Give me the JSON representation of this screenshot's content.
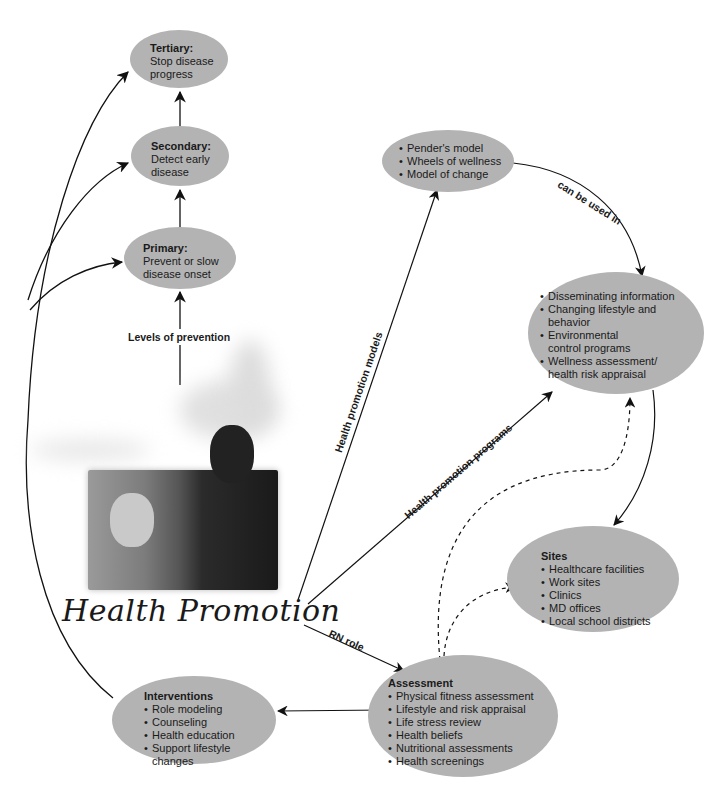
{
  "diagram": {
    "title": "Health Promotion",
    "colors": {
      "ellipse_fill": "#b3b3b3",
      "line": "#111111",
      "text": "#1a1a1a"
    },
    "prevention": {
      "link_label": "Levels of prevention",
      "tertiary": {
        "title": "Tertiary:",
        "text": "Stop disease progress"
      },
      "secondary": {
        "title": "Secondary:",
        "text": "Detect early disease"
      },
      "primary": {
        "title": "Primary:",
        "text": "Prevent or slow disease onset"
      }
    },
    "models": {
      "link_label": "Health promotion models",
      "items": [
        "Pender's model",
        "Wheels of wellness",
        "Model of change"
      ],
      "connector_label": "can be used in"
    },
    "programs": {
      "link_label": "Health promotion programs",
      "items": [
        "Disseminating information",
        "Changing lifestyle and behavior",
        "Environmental control programs",
        "Wellness assessment/ health risk appraisal"
      ]
    },
    "sites": {
      "title": "Sites",
      "items": [
        "Healthcare facilities",
        "Work sites",
        "Clinics",
        "MD offices",
        "Local school districts"
      ]
    },
    "assessment": {
      "link_label": "RN role",
      "title": "Assessment",
      "items": [
        "Physical fitness assessment",
        "Lifestyle and risk appraisal",
        "Life stress review",
        "Health beliefs",
        "Nutritional assessments",
        "Health screenings"
      ]
    },
    "interventions": {
      "title": "Interventions",
      "items": [
        "Role modeling",
        "Counseling",
        "Health education",
        "Support lifestyle changes"
      ]
    },
    "photo": {
      "alt": "photo-two-men-reading"
    }
  }
}
